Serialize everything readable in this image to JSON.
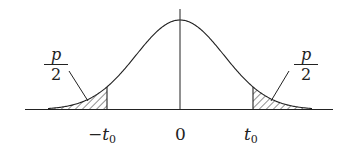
{
  "figure": {
    "colors": {
      "ink": "#222222",
      "background": "#ffffff"
    }
  },
  "labels": {
    "left_tail": {
      "numerator": "p",
      "denominator": "2"
    },
    "right_tail": {
      "numerator": "p",
      "denominator": "2"
    },
    "axis_ticks": {
      "neg_t0": {
        "sign": "−",
        "var": "t",
        "sub": "0"
      },
      "zero": "0",
      "pos_t0": {
        "var": "t",
        "sub": "0"
      }
    }
  }
}
